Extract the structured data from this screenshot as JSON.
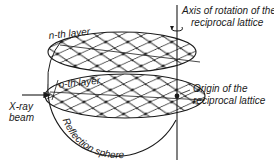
{
  "figure": {
    "labels": {
      "axis_line1": "Axis of rotation of the",
      "axis_line2": "reciprocal lattice",
      "n_layer": "n-th layer",
      "o_layer": "o-th layer",
      "xray_line1": "X-ray",
      "xray_line2": "beam",
      "origin_line1": "Origin of the",
      "origin_line2": "reciprocal lattice",
      "sphere": "Reflection sphere"
    },
    "icons": {
      "rotation": "rotation-arrow-icon",
      "beam": "arrow-right-icon"
    },
    "colors": {
      "ink": "#1a1a1a",
      "background": "#ffffff"
    }
  }
}
